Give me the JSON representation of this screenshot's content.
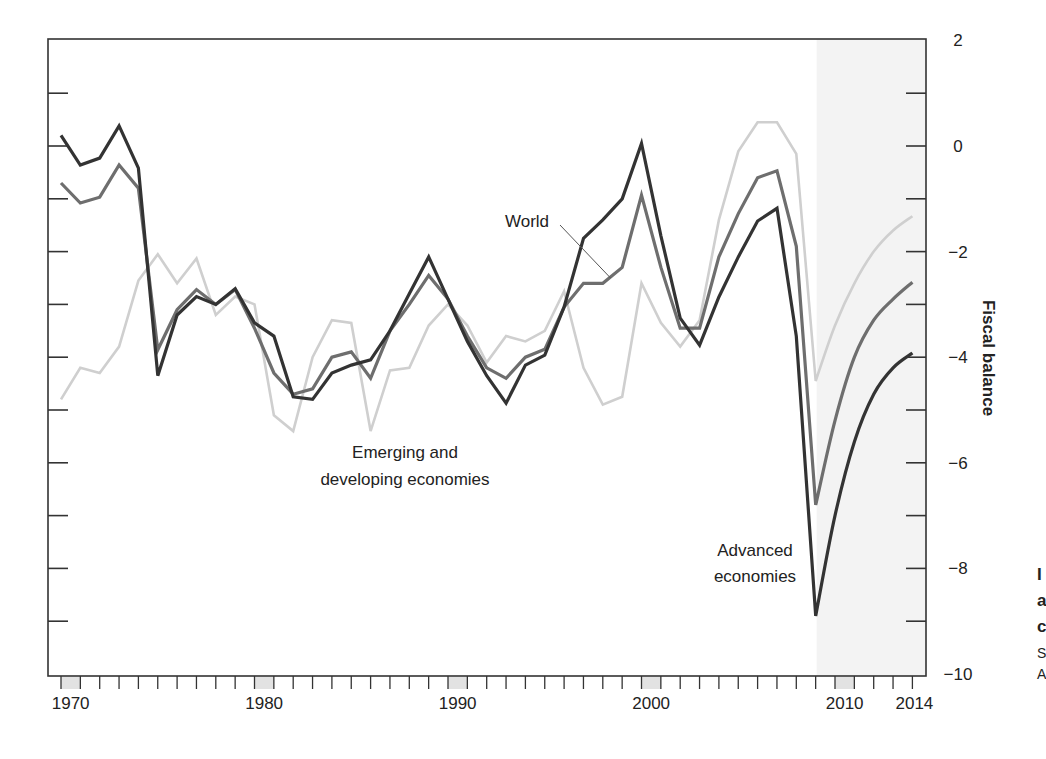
{
  "chart_data": {
    "type": "line",
    "title": "",
    "xlabel": "",
    "ylabel": "Fiscal balance",
    "xlim": [
      1970,
      2014
    ],
    "ylim": [
      -10,
      2
    ],
    "y_axis_position": "right",
    "grid": false,
    "x_tick_labels": [
      "1970",
      "1980",
      "1990",
      "2000",
      "2010",
      "2014"
    ],
    "y_tick_labels": [
      "2",
      "0",
      "−2",
      "−4",
      "−6",
      "−8",
      "−10"
    ],
    "y_ticks": [
      2,
      1,
      0,
      -1,
      -2,
      -3,
      -4,
      -5,
      -6,
      -7,
      -8,
      -9,
      -10
    ],
    "y_tick_label_values": [
      2,
      0,
      -2,
      -4,
      -6,
      -8,
      -10
    ],
    "x_label_years": [
      1970,
      1980,
      1990,
      2000,
      2010,
      2014
    ],
    "shaded_x_label_years": [
      1970,
      1980,
      1990,
      2000,
      2010
    ],
    "forecast_shading": {
      "from": 2009,
      "to": 2014,
      "color": "#f3f3f3"
    },
    "x": [
      1970,
      1971,
      1972,
      1973,
      1974,
      1975,
      1976,
      1977,
      1978,
      1979,
      1980,
      1981,
      1982,
      1983,
      1984,
      1985,
      1986,
      1987,
      1988,
      1989,
      1990,
      1991,
      1992,
      1993,
      1994,
      1995,
      1996,
      1997,
      1998,
      1999,
      2000,
      2001,
      2002,
      2003,
      2004,
      2005,
      2006,
      2007,
      2008,
      2009,
      2010,
      2011,
      2012,
      2013,
      2014
    ],
    "series": [
      {
        "name": "Emerging and developing economies",
        "color": "#cfcfcf",
        "values": [
          -4.8,
          -4.2,
          -4.3,
          -3.8,
          -2.55,
          -2.05,
          -2.6,
          -2.13,
          -3.2,
          -2.85,
          -3.0,
          -5.1,
          -5.4,
          -4.0,
          -3.3,
          -3.35,
          -5.4,
          -4.25,
          -4.2,
          -3.4,
          -3.0,
          -3.4,
          -4.1,
          -3.6,
          -3.7,
          -3.5,
          -2.75,
          -4.2,
          -4.9,
          -4.75,
          -2.6,
          -3.35,
          -3.8,
          -3.3,
          -1.4,
          -0.1,
          0.45,
          0.45,
          -0.15,
          -4.45,
          -3.4,
          -2.6,
          -2.0,
          -1.6,
          -1.33
        ]
      },
      {
        "name": "World",
        "color": "#6e6e6e",
        "values": [
          -0.7,
          -1.08,
          -0.97,
          -0.36,
          -0.8,
          -3.86,
          -3.1,
          -2.72,
          -3.0,
          -2.72,
          -3.45,
          -4.3,
          -4.7,
          -4.6,
          -4.0,
          -3.9,
          -4.4,
          -3.5,
          -3.0,
          -2.45,
          -2.9,
          -3.6,
          -4.2,
          -4.4,
          -4.0,
          -3.85,
          -3.05,
          -2.6,
          -2.6,
          -2.3,
          -0.93,
          -2.3,
          -3.45,
          -3.45,
          -2.1,
          -1.28,
          -0.6,
          -0.47,
          -1.9,
          -6.8,
          -5.2,
          -4.0,
          -3.3,
          -2.9,
          -2.58
        ]
      },
      {
        "name": "Advanced economies",
        "color": "#333333",
        "values": [
          0.2,
          -0.36,
          -0.23,
          0.38,
          -0.42,
          -4.35,
          -3.2,
          -2.85,
          -3.0,
          -2.7,
          -3.35,
          -3.6,
          -4.75,
          -4.8,
          -4.3,
          -4.15,
          -4.05,
          -3.5,
          -2.8,
          -2.1,
          -2.9,
          -3.7,
          -4.35,
          -4.87,
          -4.15,
          -3.96,
          -3.05,
          -1.75,
          -1.4,
          -1.0,
          0.05,
          -1.7,
          -3.26,
          -3.77,
          -2.86,
          -2.1,
          -1.42,
          -1.18,
          -3.6,
          -8.9,
          -7.0,
          -5.6,
          -4.7,
          -4.2,
          -3.92
        ]
      }
    ],
    "annotations": [
      {
        "text": "World",
        "x": 1996.5,
        "y": -1.4,
        "pointer_to": {
          "x": 1998.4,
          "y": -2.5
        }
      },
      {
        "text": "Emerging and developing economies",
        "lines": [
          "Emerging and",
          "developing economies"
        ],
        "x": 1987.5,
        "y": -6.0
      },
      {
        "text": "Advanced economies",
        "lines": [
          "Advanced",
          "economies"
        ],
        "x": 2006.2,
        "y": -8.2
      }
    ]
  },
  "labels": {
    "y_axis_title": "Fiscal balance",
    "annotation_world": "World",
    "annotation_emerging_line1": "Emerging and",
    "annotation_emerging_line2": "developing economies",
    "annotation_advanced_line1": "Advanced",
    "annotation_advanced_line2": "economies"
  },
  "cropped_edge_text": [
    "I",
    "a",
    "c",
    "S",
    "A"
  ],
  "colors": {
    "axis": "#333333",
    "forecast_bg": "#f3f3f3",
    "label_box": "#e2e2e2"
  }
}
